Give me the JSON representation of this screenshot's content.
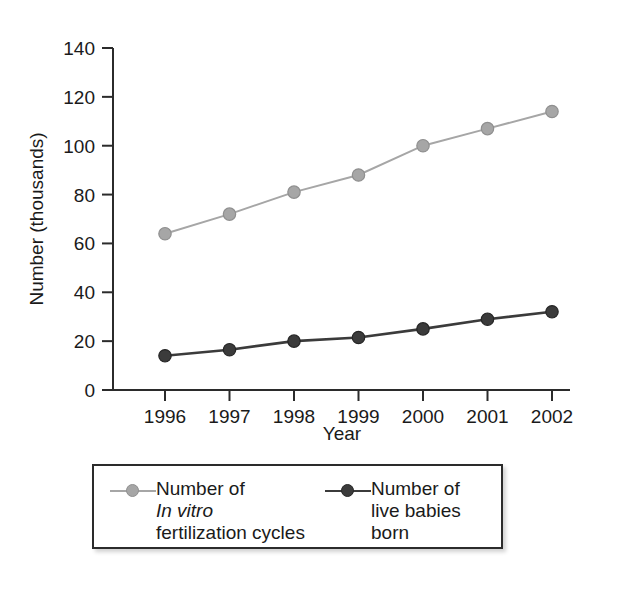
{
  "chart_data": {
    "type": "line",
    "title": "",
    "xlabel": "Year",
    "ylabel": "Number (thousands)",
    "x": [
      1996,
      1997,
      1998,
      1999,
      2000,
      2001,
      2002
    ],
    "xtick_labels": [
      "1996",
      "1997",
      "1998",
      "1999",
      "2000",
      "2001",
      "2002"
    ],
    "ytick_labels": [
      "0",
      "20",
      "40",
      "60",
      "80",
      "100",
      "120",
      "140"
    ],
    "yticks": [
      0,
      20,
      40,
      60,
      80,
      100,
      120,
      140
    ],
    "ylim": [
      0,
      140
    ],
    "grid": false,
    "legend_position": "below-plot",
    "series": [
      {
        "name": "Number of In vitro fertilization cycles",
        "legend_line1": "Number of",
        "legend_line2_italic": "In vitro",
        "legend_line3": "fertilization cycles",
        "color": "#a6a6a6",
        "values": [
          64,
          72,
          81,
          88,
          100,
          107,
          114
        ]
      },
      {
        "name": "Number of live babies born",
        "legend_line1": "Number of",
        "legend_line2": "live babies",
        "legend_line3": "born",
        "color": "#3b3b3b",
        "values": [
          14,
          16.5,
          20,
          21.5,
          25,
          29,
          32
        ]
      }
    ]
  },
  "axis": {
    "y_title": "Number (thousands)",
    "x_title": "Year",
    "axis_color": "#2b2b2b"
  }
}
